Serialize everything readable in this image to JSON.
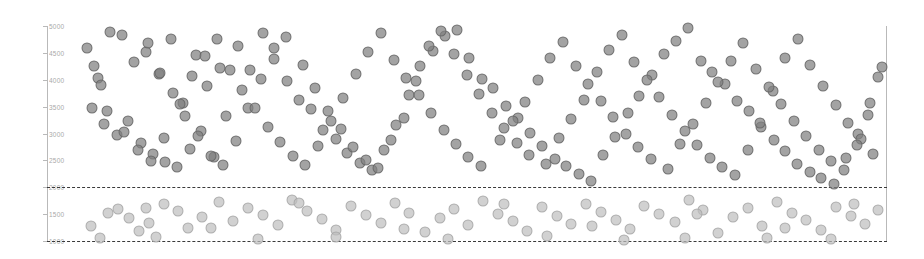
{
  "chart_data": {
    "type": "scatter",
    "title": "",
    "subtitle": "",
    "xlabel": "",
    "ylabel": "",
    "xlim": [
      0,
      924
    ],
    "ylim": [
      1000,
      5000
    ],
    "grid": false,
    "legend": null,
    "y_ticks": [
      5000,
      4500,
      4000,
      3500,
      3000,
      2500,
      2000,
      1500,
      1000
    ],
    "y_tick_labels": [
      "5000",
      "4500",
      "4000",
      "3500",
      "3000",
      "2500",
      "2000",
      "1500",
      "1000"
    ],
    "x_ticks": [],
    "x_tick_labels": [],
    "annotations": [
      {
        "name": "upper-threshold",
        "type": "hline",
        "value": 2000,
        "style": "dashed",
        "color": "#3a3a3a"
      },
      {
        "name": "lower-threshold",
        "type": "hline",
        "value": 1000,
        "style": "dashed",
        "color": "#3a3a3a"
      }
    ],
    "marker": {
      "shape": "circle",
      "size_px": 11,
      "opacity": 0.72
    },
    "series": [
      {
        "name": "above-threshold",
        "color": "#808080",
        "points": [
          [
            0.075,
            4880
          ],
          [
            0.089,
            4830
          ],
          [
            0.104,
            4330
          ],
          [
            0.118,
            4520
          ],
          [
            0.133,
            4100
          ],
          [
            0.148,
            4760
          ],
          [
            0.162,
            3560
          ],
          [
            0.177,
            4460
          ],
          [
            0.191,
            3890
          ],
          [
            0.206,
            4210
          ],
          [
            0.061,
            4040
          ],
          [
            0.054,
            3470
          ],
          [
            0.068,
            3180
          ],
          [
            0.083,
            2980
          ],
          [
            0.097,
            3240
          ],
          [
            0.112,
            2820
          ],
          [
            0.126,
            2610
          ],
          [
            0.141,
            2470
          ],
          [
            0.155,
            2380
          ],
          [
            0.17,
            2720
          ],
          [
            0.184,
            3040
          ],
          [
            0.199,
            2560
          ],
          [
            0.213,
            3330
          ],
          [
            0.228,
            4630
          ],
          [
            0.242,
            4180
          ],
          [
            0.257,
            4870
          ],
          [
            0.271,
            4390
          ],
          [
            0.286,
            3980
          ],
          [
            0.3,
            3620
          ],
          [
            0.315,
            3450
          ],
          [
            0.329,
            3060
          ],
          [
            0.344,
            2890
          ],
          [
            0.358,
            2640
          ],
          [
            0.373,
            2450
          ],
          [
            0.387,
            2330
          ],
          [
            0.402,
            2700
          ],
          [
            0.416,
            3150
          ],
          [
            0.431,
            3720
          ],
          [
            0.445,
            4260
          ],
          [
            0.46,
            4540
          ],
          [
            0.474,
            4810
          ],
          [
            0.489,
            4930
          ],
          [
            0.503,
            4410
          ],
          [
            0.518,
            4020
          ],
          [
            0.532,
            3840
          ],
          [
            0.547,
            3510
          ],
          [
            0.561,
            3290
          ],
          [
            0.576,
            3010
          ],
          [
            0.59,
            2760
          ],
          [
            0.605,
            2520
          ],
          [
            0.619,
            2390
          ],
          [
            0.634,
            2250
          ],
          [
            0.648,
            2110
          ],
          [
            0.663,
            2600
          ],
          [
            0.677,
            2940
          ],
          [
            0.692,
            3380
          ],
          [
            0.706,
            3700
          ],
          [
            0.721,
            4090
          ],
          [
            0.735,
            4480
          ],
          [
            0.75,
            4720
          ],
          [
            0.764,
            4960
          ],
          [
            0.779,
            4350
          ],
          [
            0.793,
            4140
          ],
          [
            0.808,
            3930
          ],
          [
            0.822,
            3600
          ],
          [
            0.837,
            3410
          ],
          [
            0.851,
            3120
          ],
          [
            0.866,
            2870
          ],
          [
            0.88,
            2680
          ],
          [
            0.894,
            2430
          ],
          [
            0.909,
            2290
          ],
          [
            0.923,
            2180
          ],
          [
            0.938,
            2060
          ],
          [
            0.952,
            2540
          ],
          [
            0.967,
            2990
          ],
          [
            0.981,
            3560
          ],
          [
            0.995,
            4230
          ],
          [
            0.12,
            4680
          ],
          [
            0.135,
            4120
          ],
          [
            0.15,
            3760
          ],
          [
            0.165,
            3330
          ],
          [
            0.18,
            2960
          ],
          [
            0.195,
            2580
          ],
          [
            0.21,
            2410
          ],
          [
            0.225,
            2860
          ],
          [
            0.24,
            3480
          ],
          [
            0.255,
            4010
          ],
          [
            0.27,
            4590
          ],
          [
            0.285,
            4790
          ],
          [
            0.305,
            4280
          ],
          [
            0.32,
            3850
          ],
          [
            0.335,
            3410
          ],
          [
            0.35,
            3080
          ],
          [
            0.365,
            2750
          ],
          [
            0.38,
            2510
          ],
          [
            0.395,
            2350
          ],
          [
            0.41,
            2880
          ],
          [
            0.425,
            3290
          ],
          [
            0.44,
            3970
          ],
          [
            0.455,
            4620
          ],
          [
            0.47,
            4900
          ],
          [
            0.485,
            4470
          ],
          [
            0.5,
            4080
          ],
          [
            0.515,
            3740
          ],
          [
            0.53,
            3380
          ],
          [
            0.545,
            3110
          ],
          [
            0.56,
            2820
          ],
          [
            0.575,
            2600
          ],
          [
            0.595,
            2440
          ],
          [
            0.61,
            2920
          ],
          [
            0.625,
            3270
          ],
          [
            0.64,
            3630
          ],
          [
            0.655,
            4150
          ],
          [
            0.67,
            4560
          ],
          [
            0.685,
            4840
          ],
          [
            0.7,
            4330
          ],
          [
            0.715,
            3990
          ],
          [
            0.73,
            3670
          ],
          [
            0.745,
            3350
          ],
          [
            0.76,
            3040
          ],
          [
            0.775,
            2790
          ],
          [
            0.79,
            2550
          ],
          [
            0.805,
            2370
          ],
          [
            0.82,
            2230
          ],
          [
            0.835,
            2690
          ],
          [
            0.85,
            3200
          ],
          [
            0.865,
            3790
          ],
          [
            0.88,
            4400
          ],
          [
            0.895,
            4750
          ],
          [
            0.91,
            4270
          ],
          [
            0.925,
            3880
          ],
          [
            0.94,
            3530
          ],
          [
            0.955,
            3190
          ],
          [
            0.97,
            2900
          ],
          [
            0.985,
            2620
          ],
          [
            0.048,
            4600
          ],
          [
            0.056,
            4250
          ],
          [
            0.064,
            3900
          ],
          [
            0.072,
            3420
          ],
          [
            0.092,
            3020
          ],
          [
            0.108,
            2700
          ],
          [
            0.124,
            2480
          ],
          [
            0.139,
            2920
          ],
          [
            0.158,
            3540
          ],
          [
            0.173,
            4070
          ],
          [
            0.188,
            4440
          ],
          [
            0.203,
            4760
          ],
          [
            0.218,
            4190
          ],
          [
            0.233,
            3810
          ],
          [
            0.248,
            3470
          ],
          [
            0.263,
            3130
          ],
          [
            0.278,
            2840
          ],
          [
            0.293,
            2590
          ],
          [
            0.308,
            2410
          ],
          [
            0.323,
            2760
          ],
          [
            0.338,
            3240
          ],
          [
            0.353,
            3660
          ],
          [
            0.368,
            4110
          ],
          [
            0.383,
            4520
          ],
          [
            0.398,
            4870
          ],
          [
            0.413,
            4360
          ],
          [
            0.428,
            4030
          ],
          [
            0.443,
            3720
          ],
          [
            0.458,
            3390
          ],
          [
            0.473,
            3070
          ],
          [
            0.488,
            2810
          ],
          [
            0.502,
            2570
          ],
          [
            0.517,
            2390
          ],
          [
            0.54,
            2870
          ],
          [
            0.555,
            3230
          ],
          [
            0.57,
            3580
          ],
          [
            0.585,
            4000
          ],
          [
            0.6,
            4400
          ],
          [
            0.615,
            4700
          ],
          [
            0.63,
            4250
          ],
          [
            0.645,
            3930
          ],
          [
            0.66,
            3610
          ],
          [
            0.675,
            3300
          ],
          [
            0.69,
            3000
          ],
          [
            0.705,
            2740
          ],
          [
            0.72,
            2520
          ],
          [
            0.74,
            2340
          ],
          [
            0.755,
            2800
          ],
          [
            0.77,
            3180
          ],
          [
            0.785,
            3560
          ],
          [
            0.8,
            3960
          ],
          [
            0.815,
            4340
          ],
          [
            0.83,
            4680
          ],
          [
            0.845,
            4200
          ],
          [
            0.86,
            3870
          ],
          [
            0.875,
            3540
          ],
          [
            0.89,
            3230
          ],
          [
            0.905,
            2960
          ],
          [
            0.92,
            2700
          ],
          [
            0.935,
            2480
          ],
          [
            0.95,
            2320
          ],
          [
            0.965,
            2780
          ],
          [
            0.978,
            3350
          ],
          [
            0.99,
            4050
          ]
        ]
      },
      {
        "name": "below-threshold",
        "color": "#bebebe",
        "points": [
          [
            0.052,
            1280
          ],
          [
            0.073,
            1520
          ],
          [
            0.085,
            1600
          ],
          [
            0.098,
            1420
          ],
          [
            0.11,
            1180
          ],
          [
            0.122,
            1330
          ],
          [
            0.14,
            1680
          ],
          [
            0.156,
            1550
          ],
          [
            0.168,
            1240
          ],
          [
            0.185,
            1440
          ],
          [
            0.205,
            1720
          ],
          [
            0.222,
            1380
          ],
          [
            0.24,
            1620
          ],
          [
            0.258,
            1490
          ],
          [
            0.275,
            1300
          ],
          [
            0.292,
            1760
          ],
          [
            0.31,
            1560
          ],
          [
            0.328,
            1410
          ],
          [
            0.345,
            1210
          ],
          [
            0.362,
            1650
          ],
          [
            0.38,
            1480
          ],
          [
            0.398,
            1340
          ],
          [
            0.415,
            1700
          ],
          [
            0.432,
            1520
          ],
          [
            0.45,
            1160
          ],
          [
            0.468,
            1430
          ],
          [
            0.485,
            1600
          ],
          [
            0.502,
            1290
          ],
          [
            0.52,
            1740
          ],
          [
            0.538,
            1510
          ],
          [
            0.555,
            1370
          ],
          [
            0.572,
            1190
          ],
          [
            0.59,
            1630
          ],
          [
            0.608,
            1460
          ],
          [
            0.625,
            1320
          ],
          [
            0.642,
            1690
          ],
          [
            0.66,
            1540
          ],
          [
            0.678,
            1400
          ],
          [
            0.695,
            1230
          ],
          [
            0.712,
            1660
          ],
          [
            0.73,
            1500
          ],
          [
            0.748,
            1350
          ],
          [
            0.765,
            1770
          ],
          [
            0.782,
            1570
          ],
          [
            0.8,
            1150
          ],
          [
            0.818,
            1450
          ],
          [
            0.835,
            1610
          ],
          [
            0.852,
            1280
          ],
          [
            0.87,
            1720
          ],
          [
            0.888,
            1530
          ],
          [
            0.905,
            1390
          ],
          [
            0.922,
            1200
          ],
          [
            0.94,
            1640
          ],
          [
            0.958,
            1470
          ],
          [
            0.975,
            1310
          ],
          [
            0.99,
            1580
          ],
          [
            0.063,
            1050
          ],
          [
            0.13,
            1080
          ],
          [
            0.252,
            1030
          ],
          [
            0.345,
            1070
          ],
          [
            0.478,
            1040
          ],
          [
            0.596,
            1090
          ],
          [
            0.688,
            1020
          ],
          [
            0.76,
            1060
          ],
          [
            0.858,
            1050
          ],
          [
            0.935,
            1030
          ],
          [
            0.118,
            1620
          ],
          [
            0.195,
            1250
          ],
          [
            0.3,
            1700
          ],
          [
            0.425,
            1220
          ],
          [
            0.545,
            1690
          ],
          [
            0.65,
            1270
          ],
          [
            0.775,
            1500
          ],
          [
            0.88,
            1240
          ],
          [
            0.962,
            1690
          ]
        ]
      }
    ]
  }
}
